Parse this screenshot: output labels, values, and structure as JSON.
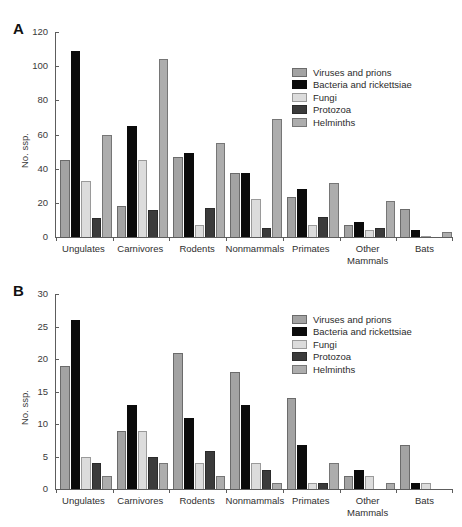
{
  "figure": {
    "panel_a_letter": "A",
    "panel_b_letter": "B"
  },
  "legend": {
    "entries": [
      {
        "label": "Viruses and prions",
        "color": "#a3a3a3"
      },
      {
        "label": "Bacteria and rickettsiae",
        "color": "#0b0b0b"
      },
      {
        "label": "Fungi",
        "color": "#dcdcdc"
      },
      {
        "label": "Protozoa",
        "color": "#3b3b3b"
      },
      {
        "label": "Helminths",
        "color": "#adadad"
      }
    ]
  },
  "chart_data": [
    {
      "type": "bar",
      "panel": "A",
      "title": "",
      "xlabel": "",
      "ylabel": "No. ssp.",
      "ylim": [
        0,
        120
      ],
      "yticks": [
        0,
        20,
        40,
        60,
        80,
        100,
        120
      ],
      "grid": false,
      "legend_position": "upper right",
      "categories": [
        "Ungulates",
        "Carnivores",
        "Rodents",
        "Nonmammals",
        "Primates",
        "Other Mammals",
        "Bats"
      ],
      "category_lines": [
        [
          "Ungulates"
        ],
        [
          "Carnivores"
        ],
        [
          "Rodents"
        ],
        [
          "Nonmammals"
        ],
        [
          "Primates"
        ],
        [
          "Other",
          "Mammals"
        ],
        [
          "Bats"
        ]
      ],
      "series": [
        {
          "name": "Viruses and prions",
          "values": [
            45,
            18,
            47,
            37.5,
            23.5,
            7,
            16.5
          ]
        },
        {
          "name": "Bacteria and rickettsiae",
          "values": [
            109,
            65,
            49,
            37.5,
            28,
            8.5,
            4
          ]
        },
        {
          "name": "Fungi",
          "values": [
            33,
            45,
            7,
            22,
            7,
            4,
            0.5
          ]
        },
        {
          "name": "Protozoa",
          "values": [
            11,
            16,
            17,
            5,
            11.5,
            5,
            0
          ]
        },
        {
          "name": "Helminths",
          "values": [
            60,
            104,
            55,
            69,
            31.5,
            21,
            3
          ]
        }
      ]
    },
    {
      "type": "bar",
      "panel": "B",
      "title": "",
      "xlabel": "",
      "ylabel": "No. ssp.",
      "ylim": [
        0,
        30
      ],
      "yticks": [
        0,
        5,
        10,
        15,
        20,
        25,
        30
      ],
      "grid": false,
      "legend_position": "upper right",
      "categories": [
        "Ungulates",
        "Carnivores",
        "Rodents",
        "Nonmammals",
        "Primates",
        "Other Mammals",
        "Bats"
      ],
      "category_lines": [
        [
          "Ungulates"
        ],
        [
          "Carnivores"
        ],
        [
          "Rodents"
        ],
        [
          "Nonmammals"
        ],
        [
          "Primates"
        ],
        [
          "Other",
          "Mammals"
        ],
        [
          "Bats"
        ]
      ],
      "series": [
        {
          "name": "Viruses and prions",
          "values": [
            19,
            9,
            21,
            18,
            14,
            2,
            6.8
          ]
        },
        {
          "name": "Bacteria and rickettsiae",
          "values": [
            26,
            13,
            11,
            13,
            6.8,
            3,
            1
          ]
        },
        {
          "name": "Fungi",
          "values": [
            5,
            9,
            4,
            4,
            1,
            2,
            1
          ]
        },
        {
          "name": "Protozoa",
          "values": [
            4,
            5,
            5.8,
            3,
            1,
            0,
            0
          ]
        },
        {
          "name": "Helminths",
          "values": [
            2,
            4,
            2,
            1,
            4,
            1,
            0
          ]
        }
      ]
    }
  ]
}
